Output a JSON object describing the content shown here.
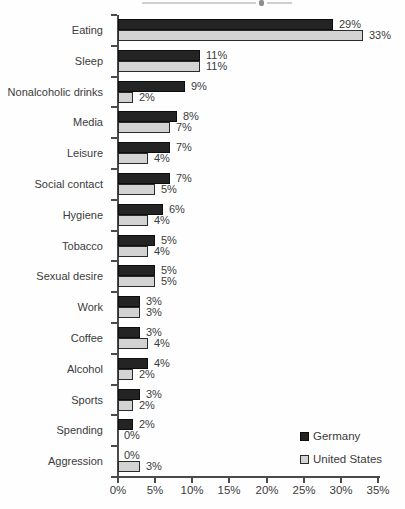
{
  "chart_data": {
    "type": "bar",
    "orientation": "horizontal",
    "categories": [
      "Eating",
      "Sleep",
      "Nonalcoholic drinks",
      "Media",
      "Leisure",
      "Social contact",
      "Hygiene",
      "Tobacco",
      "Sexual desire",
      "Work",
      "Coffee",
      "Alcohol",
      "Sports",
      "Spending",
      "Aggression"
    ],
    "series": [
      {
        "name": "Germany",
        "color": "#242424",
        "border_color": "#0d0d0d",
        "values": [
          29,
          11,
          9,
          8,
          7,
          7,
          6,
          5,
          5,
          3,
          3,
          4,
          3,
          2,
          0
        ]
      },
      {
        "name": "United States",
        "color": "#d3d3d3",
        "border_color": "#2b2b2b",
        "values": [
          33,
          11,
          2,
          7,
          4,
          5,
          4,
          4,
          5,
          3,
          4,
          2,
          2,
          0,
          3
        ]
      }
    ],
    "value_suffix": "%",
    "axis": {
      "ticks": [
        0,
        5,
        10,
        15,
        20,
        25,
        30,
        35
      ],
      "tick_labels": [
        "0%",
        "5%",
        "10%",
        "15%",
        "20%",
        "25%",
        "30%",
        "35%"
      ],
      "xlim": [
        0,
        35
      ]
    },
    "legend": {
      "position": "bottom-right",
      "items": [
        "Germany",
        "United States"
      ]
    },
    "grid": false
  },
  "colors": {
    "axis": "#4a4a4a",
    "text": "#3b3b3b",
    "background": "#fefefe"
  }
}
